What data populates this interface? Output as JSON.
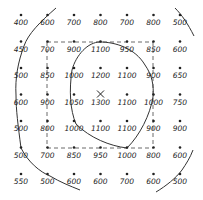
{
  "grid": {
    "rows": [
      [
        "400",
        "600",
        "700",
        "800",
        "700",
        "800",
        "500"
      ],
      [
        "450",
        "700",
        "900",
        "1100",
        "950",
        "850",
        "600"
      ],
      [
        "500",
        "850",
        "1000",
        "1200",
        "1100",
        "900",
        "650"
      ],
      [
        "600",
        "900",
        "1050",
        "1300",
        "1100",
        "1000",
        "750"
      ],
      [
        "500",
        "800",
        "1000",
        "1100",
        "1100",
        "900",
        "900"
      ],
      [
        "500",
        "700",
        "850",
        "950",
        "1000",
        "800",
        "600"
      ],
      [
        "550",
        "500",
        "600",
        "600",
        "700",
        "600",
        "500"
      ]
    ]
  },
  "peak_marker": {
    "symbol": "X",
    "row": 3,
    "col": 3
  },
  "contours": [
    {
      "name": "outer-left-contour"
    },
    {
      "name": "outer-right-top-contour"
    },
    {
      "name": "outer-right-bottom-contour"
    },
    {
      "name": "inner-closed-contour"
    }
  ],
  "dashed_box": {
    "top_left": [
      1,
      1
    ],
    "bottom_right": [
      5,
      5
    ]
  }
}
